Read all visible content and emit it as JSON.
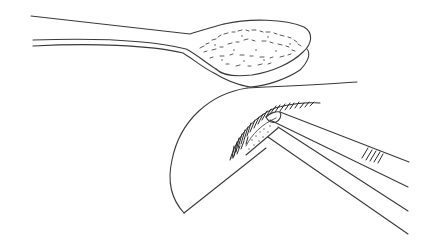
{
  "illustration": {
    "subject": "line drawing of a spoon holding powder, a curved paper sheet with powder, and forceps",
    "style": "black ink line art on white",
    "colors": {
      "background": "#ffffff",
      "ink": "#3a3a3a",
      "hatch": "#2a2a2a"
    },
    "objects": [
      {
        "name": "spoon",
        "description": "long-handled spoon with powder in bowl"
      },
      {
        "name": "paper-sheet",
        "description": "curved crescent paper with hatched powder fold"
      },
      {
        "name": "forceps",
        "description": "long forceps/tweezers with grip ridges"
      }
    ]
  }
}
